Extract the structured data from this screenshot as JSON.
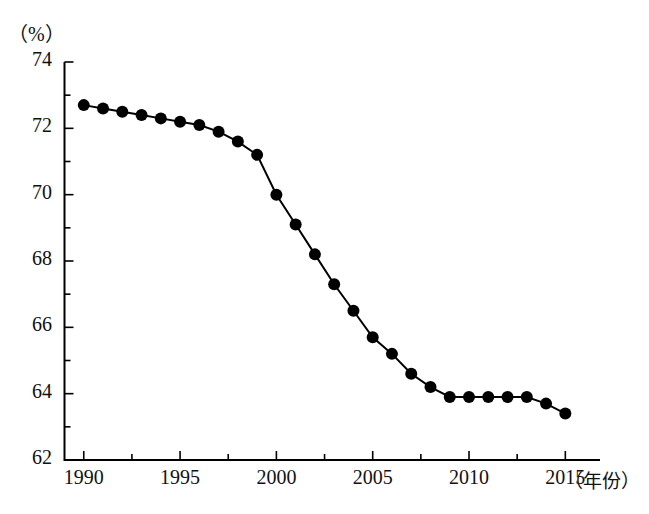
{
  "chart_data": {
    "type": "line",
    "title": "",
    "subtitle": "",
    "xlabel": "（年份）",
    "ylabel": "（%）",
    "unit_label": "（%）",
    "x": [
      1990,
      1991,
      1992,
      1993,
      1994,
      1995,
      1996,
      1997,
      1998,
      1999,
      2000,
      2001,
      2002,
      2003,
      2004,
      2005,
      2006,
      2007,
      2008,
      2009,
      2010,
      2011,
      2012,
      2013,
      2014,
      2015
    ],
    "values": [
      72.7,
      72.6,
      72.5,
      72.4,
      72.3,
      72.2,
      72.1,
      71.9,
      71.6,
      71.2,
      70.0,
      69.1,
      68.2,
      67.3,
      66.5,
      65.7,
      65.2,
      64.6,
      64.2,
      63.9,
      63.9,
      63.9,
      63.9,
      63.9,
      63.7,
      63.4
    ],
    "series": [
      {
        "name": "",
        "values": [
          72.7,
          72.6,
          72.5,
          72.4,
          72.3,
          72.2,
          72.1,
          71.9,
          71.6,
          71.2,
          70.0,
          69.1,
          68.2,
          67.3,
          66.5,
          65.7,
          65.2,
          64.6,
          64.2,
          63.9,
          63.9,
          63.9,
          63.9,
          63.9,
          63.7,
          63.4
        ]
      }
    ],
    "xlim": [
      1989.0,
      2016.8
    ],
    "ylim": [
      62,
      74
    ],
    "y_major_ticks": [
      62,
      64,
      66,
      68,
      70,
      72,
      74
    ],
    "y_minor_ticks": [
      63,
      65,
      67,
      69,
      71,
      73
    ],
    "y_tick_labels": [
      "62",
      "64",
      "66",
      "68",
      "70",
      "72",
      "74"
    ],
    "x_major_ticks": [
      1990,
      1995,
      2000,
      2005,
      2010,
      2015
    ],
    "x_minor_ticks": [
      1992.5,
      1997.5,
      2002.5,
      2007.5,
      2012.5
    ],
    "x_tick_labels": [
      "1990",
      "1995",
      "2000",
      "2005",
      "2010",
      "2015"
    ],
    "grid": false,
    "legend": "none",
    "marker": "filled-circle",
    "line_color": "#000000",
    "marker_color": "#000000",
    "axis_color": "#000000",
    "background_color": "#ffffff"
  },
  "axes": {
    "y_unit_text": "（%）",
    "x_title_text": "（年份）"
  }
}
